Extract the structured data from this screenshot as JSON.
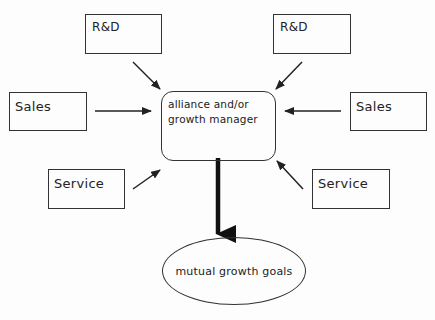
{
  "diagram": {
    "nodes": {
      "rd_left": {
        "label": "R&D"
      },
      "rd_right": {
        "label": "R&D"
      },
      "sales_left": {
        "label": "Sales"
      },
      "sales_right": {
        "label": "Sales"
      },
      "service_left": {
        "label": "Service"
      },
      "service_right": {
        "label": "Service"
      },
      "center": {
        "label": "alliance and/or\ngrowth manager"
      },
      "goal": {
        "label": "mutual growth goals"
      }
    },
    "edges": [
      {
        "from": "rd_left",
        "to": "center"
      },
      {
        "from": "rd_right",
        "to": "center"
      },
      {
        "from": "sales_left",
        "to": "center"
      },
      {
        "from": "sales_right",
        "to": "center"
      },
      {
        "from": "service_left",
        "to": "center"
      },
      {
        "from": "service_right",
        "to": "center"
      },
      {
        "from": "center",
        "to": "goal",
        "style": "thick"
      }
    ]
  }
}
